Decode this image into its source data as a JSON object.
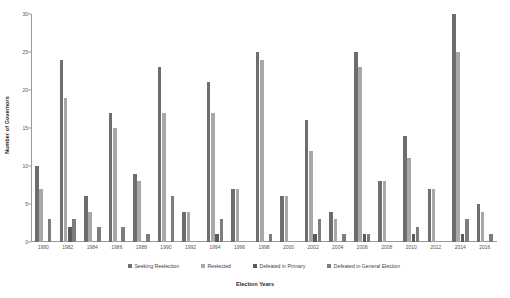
{
  "chart_data": {
    "type": "bar",
    "title": "",
    "xlabel": "Election Years",
    "ylabel": "Number of Governors",
    "ylim": [
      0,
      30
    ],
    "yticks": [
      0,
      5,
      10,
      15,
      20,
      25,
      30
    ],
    "grid": false,
    "legend_position": "bottom",
    "categories": [
      "1980",
      "1982",
      "1984",
      "1986",
      "1988",
      "1990",
      "1992",
      "1994",
      "1996",
      "1998",
      "2000",
      "2002",
      "2004",
      "2006",
      "2008",
      "2010",
      "2012",
      "2014",
      "2016"
    ],
    "series": [
      {
        "name": "Seeking Reelection",
        "color": "#6e6e6e",
        "values": [
          10,
          24,
          6,
          17,
          9,
          23,
          4,
          21,
          7,
          25,
          6,
          16,
          4,
          25,
          8,
          14,
          7,
          30,
          5
        ]
      },
      {
        "name": "Reelected",
        "color": "#a8a8a8",
        "values": [
          7,
          19,
          4,
          15,
          8,
          17,
          4,
          17,
          7,
          24,
          6,
          12,
          3,
          23,
          8,
          11,
          7,
          25,
          4
        ]
      },
      {
        "name": "Defeated in Primary",
        "color": "#5b5b5b",
        "values": [
          0,
          2,
          0,
          0,
          0,
          0,
          0,
          1,
          0,
          0,
          0,
          1,
          0,
          1,
          0,
          1,
          0,
          1,
          0
        ]
      },
      {
        "name": "Defeated in General Election",
        "color": "#7d7d7d",
        "values": [
          3,
          3,
          2,
          2,
          1,
          6,
          0,
          3,
          0,
          1,
          0,
          3,
          1,
          1,
          0,
          2,
          0,
          3,
          1
        ]
      }
    ]
  },
  "legend": {
    "items": [
      {
        "label": "Seeking Reelection"
      },
      {
        "label": "Reelected"
      },
      {
        "label": "Defeated in Primary"
      },
      {
        "label": "Defeated in General Election"
      }
    ]
  },
  "axes": {
    "y_title": "Number of Governors",
    "x_title": "Election Years",
    "y_tick_labels": [
      "0",
      "5",
      "10",
      "15",
      "20",
      "25",
      "30"
    ],
    "x_tick_labels": [
      "1980",
      "1982",
      "1984",
      "1986",
      "1988",
      "1990",
      "1992",
      "1994",
      "1996",
      "1998",
      "2000",
      "2002",
      "2004",
      "2006",
      "2008",
      "2010",
      "2012",
      "2014",
      "2016"
    ]
  }
}
